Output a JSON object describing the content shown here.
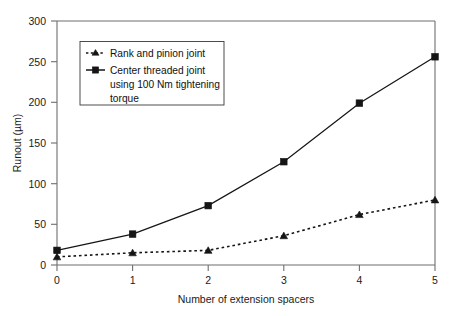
{
  "chart_data": {
    "type": "line",
    "title": "",
    "xlabel": "Number of extension spacers",
    "ylabel": "Runout (µm)",
    "x": [
      0,
      1,
      2,
      3,
      4,
      5
    ],
    "xticklabels": [
      "0",
      "1",
      "2",
      "3",
      "4",
      "5"
    ],
    "yticklabels": [
      "0",
      "50",
      "100",
      "150",
      "200",
      "250",
      "300"
    ],
    "yticks": [
      0,
      50,
      100,
      150,
      200,
      250,
      300
    ],
    "xlim": [
      0,
      5
    ],
    "ylim": [
      0,
      300
    ],
    "grid": false,
    "legend_position": "upper-left-inside",
    "series": [
      {
        "name": "Rank and pinion joint",
        "marker": "triangle",
        "linestyle": "dashed",
        "color": "#151515",
        "values": [
          10,
          15,
          18,
          36,
          62,
          80
        ]
      },
      {
        "name": "Center threaded joint using 100 Nm tightening torque",
        "marker": "square",
        "linestyle": "solid",
        "color": "#151515",
        "values": [
          18,
          38,
          73,
          127,
          199,
          256
        ]
      }
    ]
  },
  "legend": {
    "entries": [
      {
        "label": "Rank and pinion joint",
        "lines": [
          "Rank and pinion joint"
        ]
      },
      {
        "label": "Center threaded joint using 100 Nm tightening torque",
        "lines": [
          "Center threaded joint",
          "using 100 Nm tightening",
          "torque"
        ]
      }
    ]
  },
  "axes": {
    "x_title": "Number of extension spacers",
    "y_title": "Runout (µm)",
    "x_tick_labels": [
      "0",
      "1",
      "2",
      "3",
      "4",
      "5"
    ],
    "y_tick_labels": [
      "0",
      "50",
      "100",
      "150",
      "200",
      "250",
      "300"
    ]
  },
  "colors": {
    "ink": "#151515",
    "axis": "#6e6e6e",
    "background": "#ffffff"
  }
}
